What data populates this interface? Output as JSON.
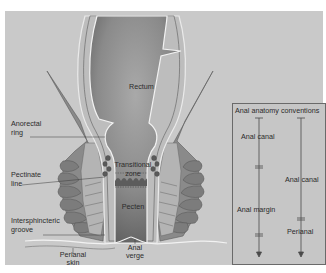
{
  "figure": {
    "background": "#c9c9c9",
    "labels": {
      "rectum": "Rectum",
      "anorectal_ring_1": "Anorectal",
      "anorectal_ring_2": "ring",
      "pectinate_line_1": "Pectinate",
      "pectinate_line_2": "line",
      "transitional_zone_1": "Transitional",
      "transitional_zone_2": "zone",
      "pecten": "Pecten",
      "intersphincteric_groove_1": "Intersphincteric",
      "intersphincteric_groove_2": "groove",
      "perianal_skin_1": "Perianal",
      "perianal_skin_2": "skin",
      "anal_verge_1": "Anal",
      "anal_verge_2": "verge"
    },
    "conventions": {
      "title": "Anal anatomy conventions",
      "left_column": [
        "Anal canal",
        "Anal margin"
      ],
      "right_column": [
        "Anal canal",
        "Perianal"
      ]
    }
  }
}
